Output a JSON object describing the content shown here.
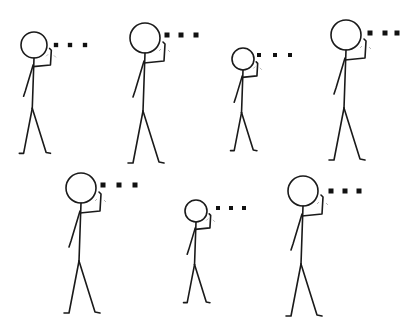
{
  "figure": {
    "colors": {
      "line": "#1a1a1a",
      "dot": "#111111",
      "background": "#ffffff"
    },
    "figures": [
      {
        "id": 1,
        "row": 1,
        "cx": 34,
        "cy": 45,
        "r": 13,
        "scale": 0.87,
        "dots_x": [
          56,
          70,
          85
        ],
        "dots_y": 45
      },
      {
        "id": 2,
        "row": 1,
        "cx": 145,
        "cy": 38,
        "r": 15,
        "scale": 1.0,
        "dots_x": [
          167,
          181,
          196
        ],
        "dots_y": 35
      },
      {
        "id": 3,
        "row": 1,
        "cx": 243,
        "cy": 59,
        "r": 11,
        "scale": 0.73,
        "dots_x": [
          259,
          275,
          290
        ],
        "dots_y": 55
      },
      {
        "id": 4,
        "row": 1,
        "cx": 346,
        "cy": 35,
        "r": 15,
        "scale": 1.02,
        "dots_x": [
          370,
          385,
          397
        ],
        "dots_y": 33
      },
      {
        "id": 5,
        "row": 2,
        "cx": 81,
        "cy": 188,
        "r": 15,
        "scale": 1.0,
        "dots_x": [
          103,
          119,
          135
        ],
        "dots_y": 185
      },
      {
        "id": 6,
        "row": 2,
        "cx": 196,
        "cy": 211,
        "r": 11,
        "scale": 0.8,
        "dots_x": [
          218,
          231,
          244
        ],
        "dots_y": 208
      },
      {
        "id": 7,
        "row": 2,
        "cx": 303,
        "cy": 191,
        "r": 15,
        "scale": 1.0,
        "dots_x": [
          331,
          345,
          359
        ],
        "dots_y": 191
      }
    ]
  }
}
